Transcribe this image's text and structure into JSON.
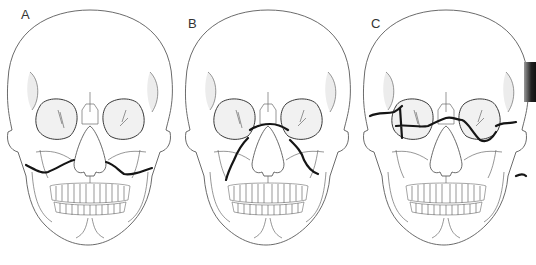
{
  "figure": {
    "background": "#ffffff",
    "line_color": "#5a5a5a",
    "fracture_color": "#151515",
    "panels": [
      {
        "label": "A",
        "fracture_type": "horizontal maxillary fracture above teeth",
        "offset_x": 0,
        "label_pos": [
          21,
          8
        ]
      },
      {
        "label": "B",
        "fracture_type": "pyramidal fracture through nasal bridge and maxilla",
        "offset_x": 178,
        "label_pos": [
          188,
          17
        ]
      },
      {
        "label": "C",
        "fracture_type": "transverse fracture through orbits and zygomatic arches",
        "offset_x": 356,
        "label_pos": [
          371,
          17
        ]
      }
    ]
  }
}
